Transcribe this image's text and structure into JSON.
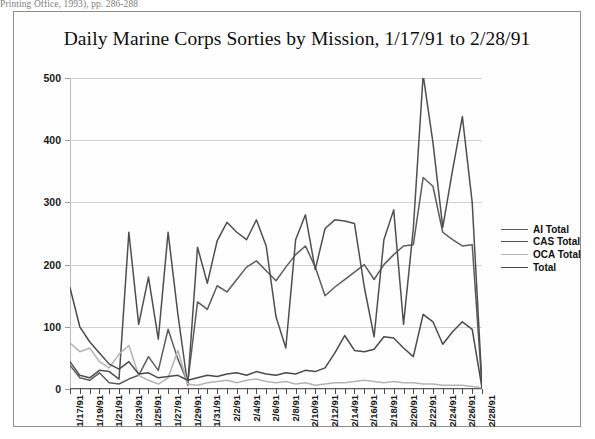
{
  "page": {
    "scan_artifact_text": "Printing Office, 1993), pp. 286-288"
  },
  "figure": {
    "title": "Daily Marine Corps Sorties by Mission, 1/17/91 to 2/28/91"
  },
  "legend": {
    "position": "right-middle",
    "entries": [
      {
        "label": "AI  Total",
        "color": "#5c5c5c"
      },
      {
        "label": "CAS Total",
        "color": "#4f4f4f"
      },
      {
        "label": "OCA Total",
        "color": "#b3b3b3"
      },
      {
        "label": "Total",
        "color": "#4a4a4a"
      }
    ]
  },
  "chart_data": {
    "type": "line",
    "title": "Daily Marine Corps Sorties by Mission, 1/17/91 to 2/28/91",
    "xlabel": "",
    "ylabel": "",
    "ylim": [
      0,
      500
    ],
    "yticks": [
      0,
      100,
      200,
      300,
      400,
      500
    ],
    "grid": true,
    "legend_position": "right",
    "x": [
      "1/17/91",
      "1/18/91",
      "1/19/91",
      "1/20/91",
      "1/21/91",
      "1/22/91",
      "1/23/91",
      "1/24/91",
      "1/25/91",
      "1/26/91",
      "1/27/91",
      "1/28/91",
      "1/29/91",
      "1/30/91",
      "1/31/91",
      "2/1/91",
      "2/2/91",
      "2/3/91",
      "2/4/91",
      "2/5/91",
      "2/6/91",
      "2/7/91",
      "2/8/91",
      "2/9/91",
      "2/10/91",
      "2/11/91",
      "2/12/91",
      "2/13/91",
      "2/14/91",
      "2/15/91",
      "2/16/91",
      "2/17/91",
      "2/18/91",
      "2/19/91",
      "2/20/91",
      "2/21/91",
      "2/22/91",
      "2/23/91",
      "2/24/91",
      "2/25/91",
      "2/26/91",
      "2/27/91",
      "2/28/91"
    ],
    "xticks": [
      "1/17/91",
      "1/19/91",
      "1/21/91",
      "1/23/91",
      "1/25/91",
      "1/27/91",
      "1/29/91",
      "1/31/91",
      "2/2/91",
      "2/4/91",
      "2/6/91",
      "2/8/91",
      "2/10/91",
      "2/12/91",
      "2/14/91",
      "2/16/91",
      "2/18/91",
      "2/20/91",
      "2/22/91",
      "2/24/91",
      "2/26/91",
      "2/28/91"
    ],
    "series": [
      {
        "name": "AI  Total",
        "color": "#5c5c5c",
        "values": [
          38,
          18,
          14,
          26,
          10,
          8,
          16,
          22,
          52,
          30,
          96,
          48,
          10,
          140,
          128,
          166,
          156,
          176,
          196,
          206,
          190,
          174,
          196,
          216,
          230,
          196,
          150,
          164,
          176,
          188,
          200,
          176,
          200,
          216,
          230,
          232,
          340,
          326,
          252,
          240,
          230,
          232,
          4
        ]
      },
      {
        "name": "CAS Total",
        "color": "#4f4f4f",
        "values": [
          44,
          22,
          18,
          30,
          28,
          16,
          252,
          104,
          180,
          80,
          252,
          120,
          6,
          228,
          170,
          238,
          268,
          252,
          240,
          272,
          230,
          116,
          66,
          240,
          280,
          192,
          258,
          272,
          270,
          266,
          164,
          84,
          240,
          288,
          104,
          258,
          505,
          396,
          260,
          352,
          438,
          300,
          6
        ]
      },
      {
        "name": "OCA Total",
        "color": "#b3b3b3",
        "values": [
          74,
          60,
          66,
          44,
          34,
          56,
          70,
          22,
          14,
          8,
          18,
          62,
          8,
          6,
          10,
          12,
          14,
          10,
          14,
          16,
          12,
          10,
          12,
          8,
          10,
          6,
          8,
          10,
          10,
          12,
          14,
          12,
          10,
          12,
          10,
          10,
          8,
          8,
          6,
          6,
          6,
          4,
          2
        ]
      },
      {
        "name": "Total",
        "color": "#4a4a4a",
        "values": [
          163,
          100,
          76,
          58,
          40,
          32,
          44,
          24,
          26,
          18,
          20,
          22,
          14,
          18,
          22,
          20,
          24,
          26,
          22,
          28,
          24,
          22,
          26,
          24,
          30,
          28,
          34,
          58,
          86,
          62,
          60,
          64,
          84,
          82,
          66,
          52,
          120,
          108,
          72,
          92,
          108,
          96,
          2
        ]
      }
    ]
  }
}
